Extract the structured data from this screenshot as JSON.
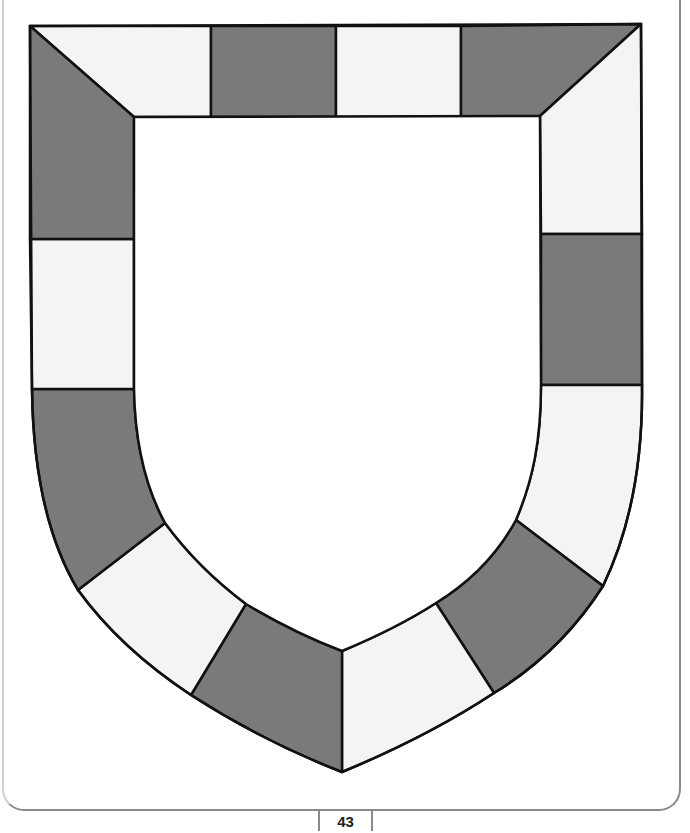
{
  "page": {
    "page_number": "43"
  },
  "colors": {
    "dark_space": "#7a7a7a",
    "light_space": "#f4f4f4",
    "outline": "#111111",
    "center": "#ffffff"
  },
  "board": {
    "shape": "shield",
    "space_count": 16,
    "spaces": [
      {
        "id": 1,
        "shade": "light",
        "d": "M30,26 L211,26 L211,117 L134,117 Z"
      },
      {
        "id": 2,
        "shade": "dark",
        "d": "M211,26 L336,26 L336,117 L211,117 Z"
      },
      {
        "id": 3,
        "shade": "light",
        "d": "M336,26 L461,26 L461,117 L336,117 Z"
      },
      {
        "id": 4,
        "shade": "dark",
        "d": "M461,26 L641,24 L540,116 L461,117 Z"
      },
      {
        "id": 5,
        "shade": "light",
        "d": "M641,24 L642,234 L541,234 L540,116 Z"
      },
      {
        "id": 6,
        "shade": "dark",
        "d": "M642,234 L642,385 L541,385 L541,234 Z"
      },
      {
        "id": 7,
        "shade": "light",
        "d": "M642,385 C643,460 630,530 603,586 L516,520 C533,480 541,440 541,385 Z"
      },
      {
        "id": 8,
        "shade": "dark",
        "d": "M603,586 C575,630 540,665 494,693 L436,603 C470,582 497,555 516,520 Z"
      },
      {
        "id": 9,
        "shade": "light",
        "d": "M494,693 C450,722 400,748 342,772 L342,651 C378,636 408,621 436,603 Z"
      },
      {
        "id": 10,
        "shade": "dark",
        "d": "M342,772 C285,750 236,724 191,695 L246,604 C276,622 308,638 342,651 Z"
      },
      {
        "id": 11,
        "shade": "light",
        "d": "M191,695 C144,664 107,630 78,590 L165,523 C187,553 214,580 246,604 Z"
      },
      {
        "id": 12,
        "shade": "dark",
        "d": "M78,590 C48,540 33,470 32,389 L134,389 C135,445 146,488 165,523 Z"
      },
      {
        "id": 13,
        "shade": "light",
        "d": "M32,389 L30,239 L134,239 L134,389 Z"
      },
      {
        "id": 14,
        "shade": "dark",
        "d": "M30,239 L30,26 L134,117 L134,239 Z"
      }
    ],
    "outer_path": "M30,26 L641,24 L642,385 C643,460 630,530 603,586 C575,630 540,665 494,693 C450,722 400,748 342,772 C285,750 236,724 191,695 C144,664 107,630 78,590 C48,540 33,470 32,389 Z",
    "inner_path": "M134,117 L540,116 L541,385 C541,440 533,480 516,520 C497,555 470,582 436,603 C408,621 378,636 342,651 C308,638 276,622 246,604 C214,580 187,553 165,523 C146,488 135,445 134,389 Z"
  }
}
